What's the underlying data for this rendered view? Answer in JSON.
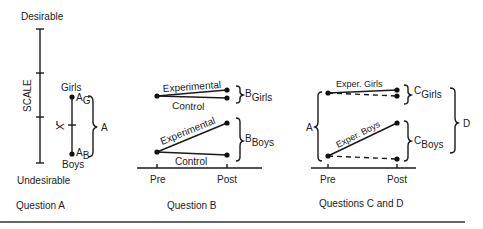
{
  "question_a": {
    "top_label": "Desirable",
    "bottom_label": "Undesirable",
    "axis_label": "SCALE",
    "girls_label": "Girls",
    "boys_label": "Boys",
    "ag_main": "A",
    "ag_sub": "G",
    "ab_main": "A",
    "ab_sub": "B",
    "mean_label": "X",
    "brace_label": "A",
    "caption": "Question A"
  },
  "question_b": {
    "girls_exp_label": "Experimental",
    "girls_ctrl_label": "Control",
    "boys_exp_label": "Experimental",
    "boys_ctrl_label": "Control",
    "b_girls_main": "B",
    "b_girls_sub": "Girls",
    "b_boys_main": "B",
    "b_boys_sub": "Boys",
    "pre_label": "Pre",
    "post_label": "Post",
    "caption": "Question B"
  },
  "question_cd": {
    "girls_exp_label": "Exper. Girls",
    "boys_exp_label": "Exper. Boys",
    "c_girls_main": "C",
    "c_girls_sub": "Girls",
    "c_boys_main": "C",
    "c_boys_sub": "Boys",
    "a_label": "A",
    "d_label": "D",
    "pre_label": "Pre",
    "post_label": "Post",
    "caption": "Questions C and D"
  }
}
